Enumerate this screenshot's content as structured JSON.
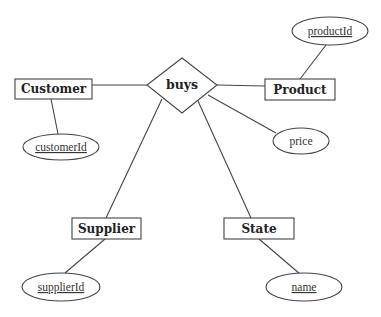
{
  "diagram": {
    "type": "er-diagram",
    "relationship": {
      "label": "buys"
    },
    "entities": [
      {
        "id": "customer",
        "label": "Customer"
      },
      {
        "id": "product",
        "label": "Product"
      },
      {
        "id": "supplier",
        "label": "Supplier"
      },
      {
        "id": "state",
        "label": "State"
      }
    ],
    "attributes": [
      {
        "id": "customerId",
        "label": "customerId",
        "key": true,
        "of": "Customer"
      },
      {
        "id": "productId",
        "label": "productId",
        "key": true,
        "of": "Product"
      },
      {
        "id": "price",
        "label": "price",
        "key": false,
        "of": "buys"
      },
      {
        "id": "supplierId",
        "label": "supplierId",
        "key": true,
        "of": "Supplier"
      },
      {
        "id": "name",
        "label": "name",
        "key": true,
        "of": "State"
      }
    ]
  }
}
